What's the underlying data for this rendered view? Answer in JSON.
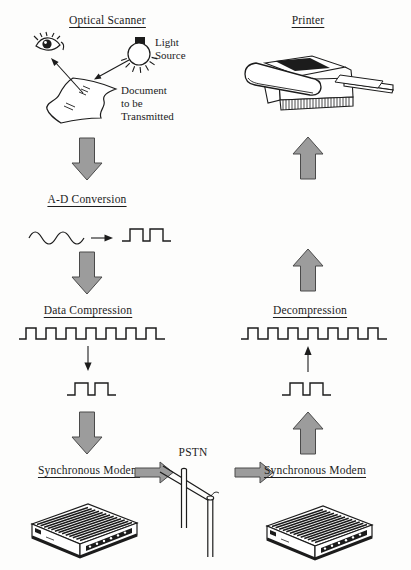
{
  "diagram": {
    "background": "#fdfdfc",
    "ink_color": "#1c1c1c",
    "arrow_fill": "#9c9c9c",
    "arrow_stroke": "#4a4a4a",
    "labels": {
      "optical_scanner": "Optical Scanner",
      "light_source": "Light\nSource",
      "document": "Document\nto be\nTransmitted",
      "ad_conversion": "A-D Conversion",
      "data_compression": "Data Compression",
      "synchronous_modem_left": "Synchronous Modem",
      "pstn": "PSTN",
      "synchronous_modem_right": "Synchronous Modem",
      "decompression": "Decompression",
      "printer": "Printer"
    },
    "flow": {
      "transmit": [
        "Optical Scanner",
        "A-D Conversion",
        "Data Compression",
        "Synchronous Modem"
      ],
      "network": "PSTN",
      "receive": [
        "Synchronous Modem",
        "Decompression",
        "Printer"
      ]
    },
    "icons": [
      "eye-icon",
      "light-bulb-icon",
      "document-icon",
      "sine-wave-icon",
      "square-wave-icon",
      "thin-arrow-icon",
      "block-arrow-down-icon",
      "block-arrow-up-icon",
      "block-arrow-right-icon",
      "modem-icon",
      "telephone-pole-icon",
      "printer-icon"
    ]
  }
}
